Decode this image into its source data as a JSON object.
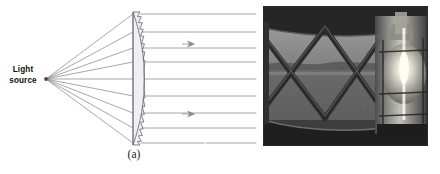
{
  "figure": {
    "kind": "two-panel scientific figure",
    "background_color": "#ffffff"
  },
  "panel_a": {
    "name": "Fresnel lens ray diagram",
    "caption": "(a)",
    "source_label_line1": "Light",
    "source_label_line2": "source",
    "line_color": "#8a8a92",
    "lens_fill": "#f0f0f2",
    "lens_stroke": "#6e6e76",
    "source_point": {
      "x": 46,
      "y": 79
    },
    "lens_back_x": 133,
    "lens_top_y": 12,
    "lens_bottom_y": 145,
    "incident_ray_count": 9,
    "outgoing_ray_count": 9,
    "outgoing_ray_end_x": 256,
    "ray_y_positions": [
      14,
      32,
      48,
      62,
      79,
      96,
      113,
      128,
      143
    ],
    "arrow_marker_count": 2,
    "arrow_markers": [
      {
        "x": 190,
        "y": 44
      },
      {
        "x": 190,
        "y": 114
      }
    ]
  },
  "panel_b": {
    "name": "lighthouse Fresnel lens photograph",
    "caption": "(b)",
    "description": "grayscale photo of lighthouse lantern room interior with Fresnel lens and lamp",
    "border_color": "#2b2b2b",
    "tones": {
      "sky": "#8c8c8c",
      "water": "#6e6e6e",
      "far_shore": "#5a5a5a",
      "frame_dark": "#2e2e2e",
      "glass_mid": "#747474",
      "lamp_bright": "#f2f0e8",
      "lens_ring": "#3a3a3a",
      "floor": "#212121"
    }
  }
}
